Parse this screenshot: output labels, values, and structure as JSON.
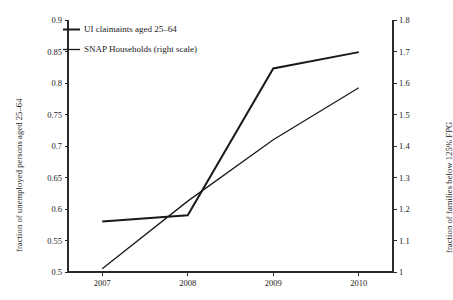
{
  "chart_data": {
    "type": "line",
    "title": "",
    "subtitle": "",
    "xlabel": "",
    "ylabel": "fraction of unemployed persons aged 25–64",
    "ylabel_right": "fraction of families below 125% FPG",
    "x": [
      2007,
      2008,
      2009,
      2010
    ],
    "xtick_labels": [
      "2007",
      "2008",
      "2009",
      "2010"
    ],
    "xlim": [
      2006.6,
      2010.4
    ],
    "ylim": [
      0.5,
      0.9
    ],
    "ylim_right": [
      1.0,
      1.8
    ],
    "ytick_labels": [
      "0.5",
      "0.55",
      "0.6",
      "0.65",
      "0.7",
      "0.75",
      "0.8",
      "0.85",
      "0.9"
    ],
    "ytick_values": [
      0.5,
      0.55,
      0.6,
      0.65,
      0.7,
      0.75,
      0.8,
      0.85,
      0.9
    ],
    "ytick_right_labels": [
      "1",
      "1.1",
      "1.2",
      "1.3",
      "1.4",
      "1.5",
      "1.6",
      "1.7",
      "1.8"
    ],
    "ytick_right_values": [
      1.0,
      1.1,
      1.2,
      1.3,
      1.4,
      1.5,
      1.6,
      1.7,
      1.8
    ],
    "grid": false,
    "legend_position": "upper left",
    "series": [
      {
        "name": "UI claimaints aged 25–64",
        "axis": "left",
        "color": "#1a1a1a",
        "line_width": 2.0,
        "values": [
          0.58,
          0.59,
          0.823,
          0.849
        ]
      },
      {
        "name": "SNAP Households (right scale)",
        "axis": "right",
        "color": "#1a1a1a",
        "line_width": 1.3,
        "values": [
          1.01,
          1.225,
          1.42,
          1.585
        ]
      }
    ]
  },
  "legend": {
    "entries": [
      {
        "label": "UI claimaints aged 25–64"
      },
      {
        "label": "SNAP Households (right scale)"
      }
    ]
  }
}
